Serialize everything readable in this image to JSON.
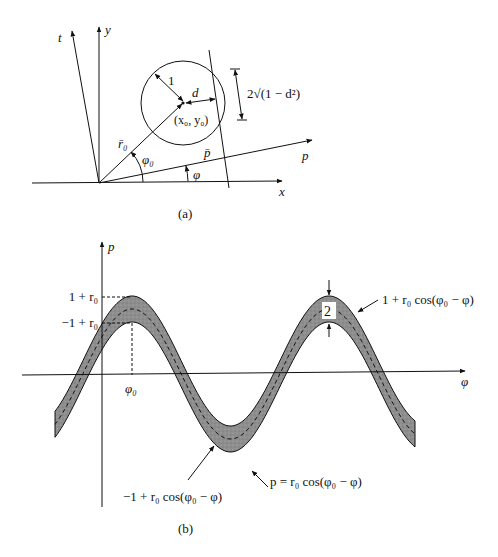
{
  "panel_a": {
    "caption": "(a)",
    "axes": {
      "x": "x",
      "y": "y",
      "t": "t",
      "p": "p"
    },
    "labels": {
      "radius": "1",
      "distance": "d",
      "center": "(x₀, y₀)",
      "chord": "2√(1 − d²)",
      "r0_vector": "r̄₀",
      "p_vector": "p̄",
      "angle_phi0": "φ₀",
      "angle_phi": "φ"
    }
  },
  "panel_b": {
    "caption": "(b)",
    "axes": {
      "vertical": "p",
      "horizontal": "φ"
    },
    "tick_labels": {
      "upper": "1 + r₀",
      "lower": "−1 + r₀",
      "phi0": "φ₀"
    },
    "band_width_label": "2",
    "curve_labels": {
      "upper": "1 + r₀ cos(φ₀ − φ)",
      "center": "p = r₀ cos(φ₀ − φ)",
      "lower": "−1 + r₀ cos(φ₀ − φ)"
    },
    "colors": {
      "band_fill": "#8c8c8c",
      "line": "#111111"
    }
  }
}
